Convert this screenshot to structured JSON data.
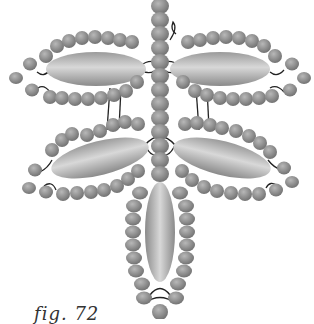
{
  "figure": {
    "caption": "fig. 72",
    "colors": {
      "bead": "#8a8a8a",
      "bead_highlight": "#b5b5b5",
      "oval_bead": "#a8a8a8",
      "oval_highlight": "#d6d6d6",
      "thread": "#222222",
      "background": "#ffffff"
    },
    "components": [
      {
        "name": "stem",
        "type": "bead column",
        "position": "center vertical"
      },
      {
        "name": "upper-left-leaf",
        "type": "oval bead with bead loop"
      },
      {
        "name": "upper-right-leaf",
        "type": "oval bead with bead loop"
      },
      {
        "name": "lower-left-leaf",
        "type": "oval bead with bead loop"
      },
      {
        "name": "lower-right-leaf",
        "type": "oval bead with bead loop"
      },
      {
        "name": "bottom-leaf",
        "type": "vertical oval bead with bead loop"
      }
    ]
  }
}
